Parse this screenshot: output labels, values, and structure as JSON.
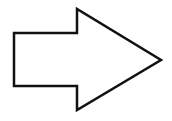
{
  "diagram": {
    "shape": "right-arrow",
    "stroke_color": "#111111",
    "fill_color": "#ffffff",
    "stroke_width": 2.5,
    "points": "14,33 77,33 77,9 161,60 77,110 77,86 14,86"
  }
}
